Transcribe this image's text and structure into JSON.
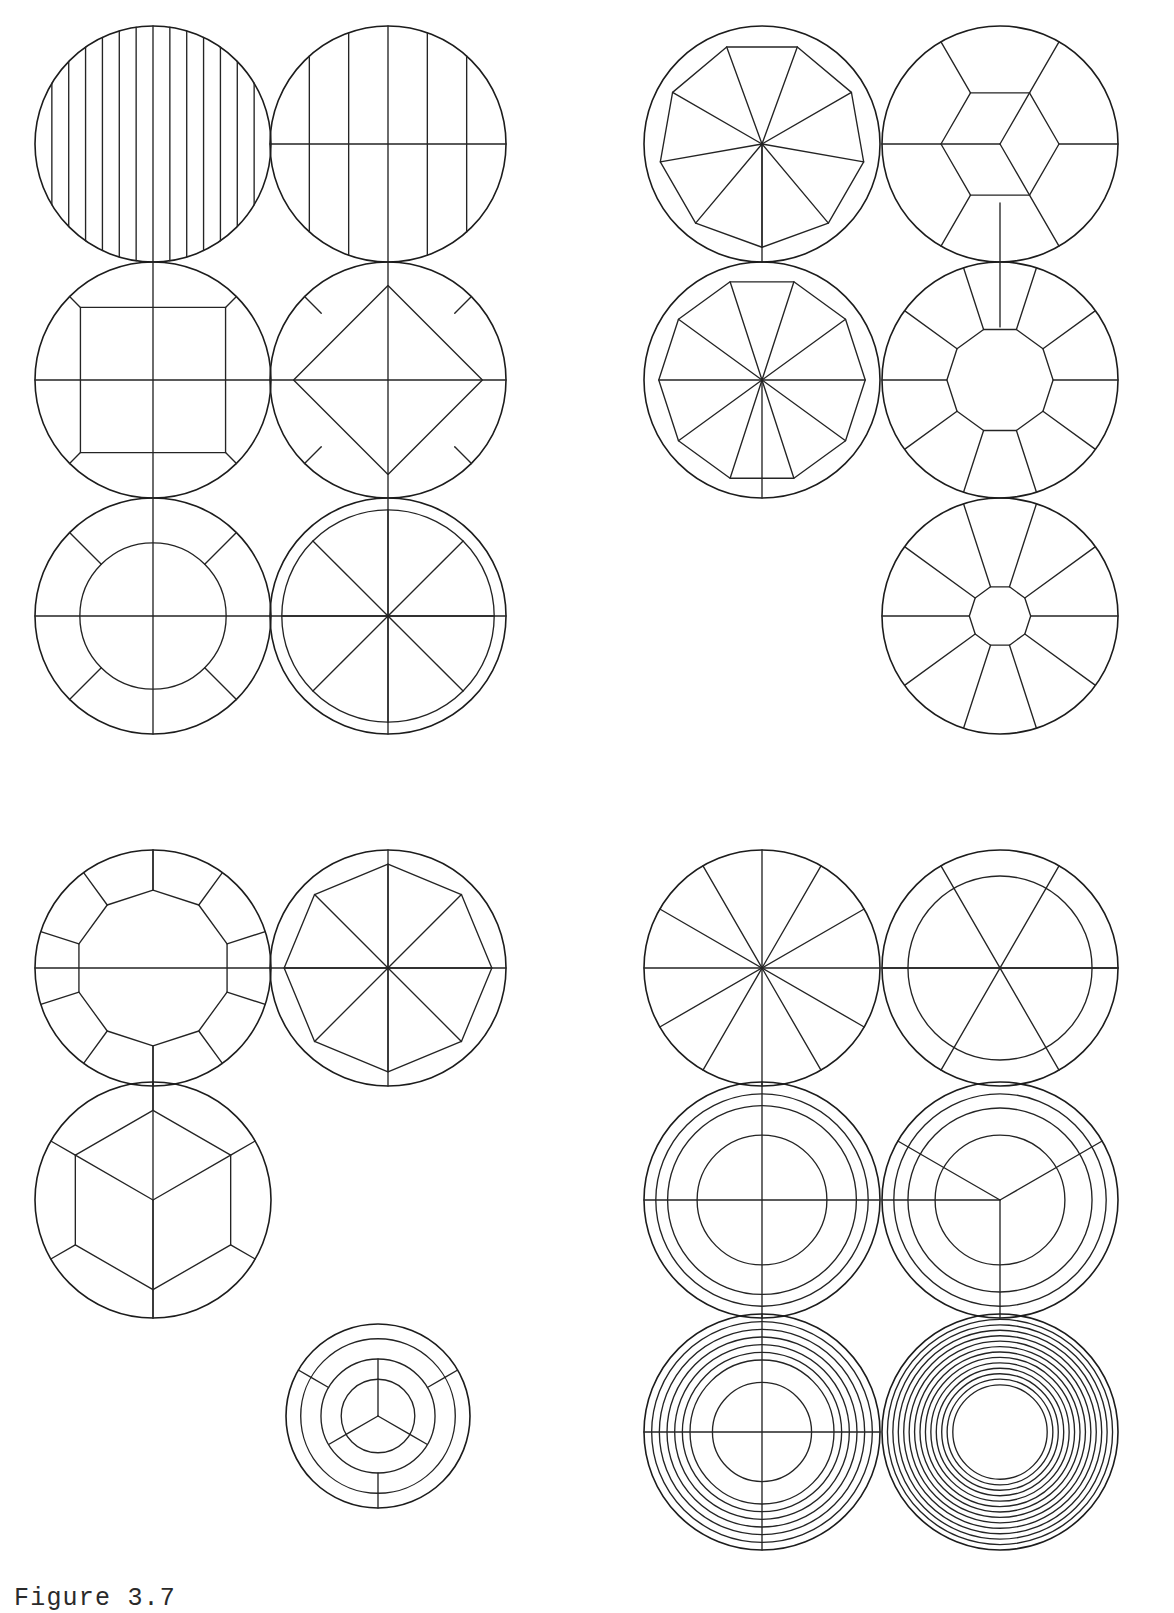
{
  "page": {
    "width": 1174,
    "height": 1613,
    "background_color": "#ffffff",
    "ink_color": "#1c1c1c",
    "caption": "Figure 3.7"
  },
  "figure": {
    "title": "Figure 3.7",
    "stroke_color": "#1c1c1c",
    "stroke_width": 1.6
  },
  "chart_data": {
    "type": "diagram",
    "title": "Figure 3.7",
    "xlabel": "",
    "ylabel": "",
    "groups": [
      {
        "name": "top-left-group",
        "circles": [
          {
            "id": "tl-1",
            "label": "circle-vertical-stripes-fine",
            "cx": 153,
            "cy": 144,
            "r": 118,
            "pattern": "parallel-vertical-lines",
            "line_count": 13
          },
          {
            "id": "tl-2",
            "label": "circle-vertical-stripes-coarse-with-diameter",
            "cx": 388,
            "cy": 144,
            "r": 118,
            "pattern": "parallel-vertical-lines-plus-horizontal-diameter",
            "line_count": 5
          },
          {
            "id": "tl-3",
            "label": "circle-inscribed-square-axis-aligned",
            "cx": 153,
            "cy": 380,
            "r": 118,
            "pattern": "inscribed-square-with-cross-axes",
            "line_count": 4
          },
          {
            "id": "tl-4",
            "label": "circle-inscribed-diamond",
            "cx": 388,
            "cy": 380,
            "r": 118,
            "pattern": "inscribed-rotated-square-with-cross-axes",
            "line_count": 4
          },
          {
            "id": "tl-5",
            "label": "circle-annulus-four-diagonal-spokes",
            "cx": 153,
            "cy": 616,
            "r": 118,
            "pattern": "concentric-annulus-diagonal-spokes",
            "inner_ratio": 0.62,
            "spoke_count": 4
          },
          {
            "id": "tl-6",
            "label": "circle-thin-ring-eight-sectors",
            "cx": 388,
            "cy": 616,
            "r": 118,
            "pattern": "thin-ring-with-eight-sectors",
            "inner_ratio": 0.9,
            "spoke_count": 8
          }
        ]
      },
      {
        "name": "top-right-group",
        "circles": [
          {
            "id": "tr-1",
            "label": "circle-inscribed-nonagon-with-radii",
            "cx": 762,
            "cy": 144,
            "r": 118,
            "pattern": "inscribed-polygon-with-radii",
            "sides": 9
          },
          {
            "id": "tr-2",
            "label": "circle-hexagon-core-with-outer-ring-cells",
            "cx": 1000,
            "cy": 144,
            "r": 118,
            "pattern": "hexagon-core-three-spokes-outer-ring",
            "sides": 6,
            "spoke_count": 3
          },
          {
            "id": "tr-3",
            "label": "circle-inscribed-decagon-with-radii",
            "cx": 762,
            "cy": 380,
            "r": 118,
            "pattern": "inscribed-polygon-with-radii",
            "sides": 10
          },
          {
            "id": "tr-4",
            "label": "circle-annulus-ten-spokes-polygon-core",
            "cx": 1000,
            "cy": 380,
            "r": 118,
            "pattern": "polygon-core-with-ring-spokes",
            "sides": 10,
            "inner_ratio": 0.45,
            "spoke_count": 10
          },
          {
            "id": "tr-5",
            "label": "circle-small-core-ten-radial-spokes",
            "cx": 1000,
            "cy": 616,
            "r": 118,
            "pattern": "small-polygon-core-radial-spokes",
            "sides": 10,
            "inner_ratio": 0.26,
            "spoke_count": 10
          }
        ]
      },
      {
        "name": "bottom-left-group",
        "circles": [
          {
            "id": "bl-1",
            "label": "circle-decagon-core-with-edge-radii",
            "cx": 153,
            "cy": 968,
            "r": 118,
            "pattern": "inner-polygon-with-vertex-radii",
            "sides": 10,
            "inner_ratio": 0.66
          },
          {
            "id": "bl-2",
            "label": "circle-inscribed-octagon-with-radii",
            "cx": 388,
            "cy": 968,
            "r": 118,
            "pattern": "inscribed-polygon-with-center-radii",
            "sides": 8,
            "inner_ratio": 0.88
          },
          {
            "id": "bl-3",
            "label": "circle-inscribed-hexagon-three-spokes",
            "cx": 153,
            "cy": 1200,
            "r": 118,
            "pattern": "inner-hexagon-three-spokes-vertex-radii",
            "sides": 6,
            "inner_ratio": 0.76,
            "spoke_count": 3
          },
          {
            "id": "bl-4",
            "label": "circle-small-three-ring-rosette",
            "cx": 378,
            "cy": 1416,
            "r": 92,
            "pattern": "three-ring-three-fold-division",
            "ring_count": 3,
            "spoke_count": 3
          }
        ]
      },
      {
        "name": "bottom-right-group",
        "circles": [
          {
            "id": "br-1",
            "label": "circle-twelve-sectors",
            "cx": 762,
            "cy": 968,
            "r": 118,
            "pattern": "radial-sectors",
            "spoke_count": 12
          },
          {
            "id": "br-2",
            "label": "circle-ring-with-six-sectors",
            "cx": 1000,
            "cy": 968,
            "r": 118,
            "pattern": "annulus-six-sectors",
            "inner_ratio": 0.78,
            "spoke_count": 6
          },
          {
            "id": "br-3",
            "label": "circle-three-rings-with-cross-axes",
            "cx": 762,
            "cy": 1200,
            "r": 118,
            "pattern": "concentric-rings-with-cross-axes",
            "ring_count": 3,
            "spoke_count": 4
          },
          {
            "id": "br-4",
            "label": "circle-three-rings-three-spokes",
            "cx": 1000,
            "cy": 1200,
            "r": 118,
            "pattern": "concentric-rings-three-fold",
            "ring_count": 3,
            "spoke_count": 3
          },
          {
            "id": "br-5",
            "label": "circle-six-rings-with-cross-axes",
            "cx": 762,
            "cy": 1432,
            "r": 118,
            "pattern": "many-concentric-rings-with-cross-axes",
            "ring_count": 6,
            "spoke_count": 4
          },
          {
            "id": "br-6",
            "label": "circle-twelve-concentric-rings",
            "cx": 1000,
            "cy": 1432,
            "r": 118,
            "pattern": "many-concentric-rings",
            "ring_count": 12,
            "spoke_count": 0
          }
        ]
      }
    ]
  }
}
